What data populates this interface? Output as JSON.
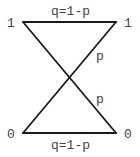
{
  "diagram": {
    "type": "binary-channel",
    "nodes": {
      "top_left": {
        "label": "1"
      },
      "top_right": {
        "label": "1"
      },
      "bottom_left": {
        "label": "0"
      },
      "bottom_right": {
        "label": "0"
      }
    },
    "edges": {
      "top": {
        "label": "q=1-p",
        "from": "top_left",
        "to": "top_right"
      },
      "bottom": {
        "label": "q=1-p",
        "from": "bottom_left",
        "to": "bottom_right"
      },
      "diag_up": {
        "label": "p",
        "from": "bottom_left",
        "to": "top_right"
      },
      "diag_down": {
        "label": "p",
        "from": "top_left",
        "to": "bottom_right"
      }
    },
    "colors": {
      "line": "#1a1a1a",
      "text": "#444444",
      "background": "#ffffff"
    }
  }
}
